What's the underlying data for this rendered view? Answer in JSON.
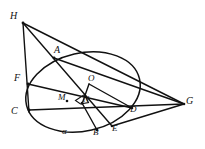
{
  "figure": {
    "background_color": "#ffffff",
    "stroke_color": "#111111",
    "width": 205,
    "height": 149,
    "conic": {
      "name": "ellipse",
      "center_x": 83,
      "center_y": 92,
      "radius_x": 58,
      "radius_y": 39,
      "rotation_deg": -13
    },
    "points": [
      {
        "id": "H",
        "label": "H",
        "x": 23,
        "y": 23,
        "label_x": 10,
        "label_y": 11
      },
      {
        "id": "A",
        "label": "A",
        "x": 54,
        "y": 58,
        "label_x": 54,
        "label_y": 45
      },
      {
        "id": "F",
        "label": "F",
        "x": 28,
        "y": 84,
        "label_x": 14,
        "label_y": 73
      },
      {
        "id": "C",
        "label": "C",
        "x": 29,
        "y": 110,
        "label_x": 11,
        "label_y": 106
      },
      {
        "id": "O",
        "label": "O",
        "x": 89,
        "y": 84,
        "label_x": 88,
        "label_y": 74
      },
      {
        "id": "M",
        "label": "M",
        "x": 67,
        "y": 101,
        "label_x": 58,
        "label_y": 93
      },
      {
        "id": "N",
        "label": "N",
        "x": 82,
        "y": 103,
        "label_x": 83,
        "label_y": 95
      },
      {
        "id": "D",
        "label": "D",
        "x": 132,
        "y": 108,
        "label_x": 130,
        "label_y": 105
      },
      {
        "id": "G",
        "label": "G",
        "x": 184,
        "y": 104,
        "label_x": 186,
        "label_y": 96
      },
      {
        "id": "B",
        "label": "B",
        "x": 97,
        "y": 129,
        "label_x": 93,
        "label_y": 128
      },
      {
        "id": "E",
        "label": "E",
        "x": 112,
        "y": 126,
        "label_x": 112,
        "label_y": 124
      }
    ],
    "annotations": [
      {
        "id": "alpha",
        "label": "α",
        "x": 62,
        "y": 127
      }
    ],
    "segments": [
      {
        "id": "H-G",
        "from": "H",
        "to": "G",
        "note": "upper long chord"
      },
      {
        "id": "H-C",
        "from": "H",
        "to": "C",
        "note": "near vertical left side"
      },
      {
        "id": "H-E",
        "from": "H",
        "to": "E",
        "note": "through A and N"
      },
      {
        "id": "A-G",
        "from": "A",
        "to": "G",
        "note": "through D"
      },
      {
        "id": "C-G",
        "from": "C",
        "to": "G",
        "note": "horizontal baseline through N and D"
      },
      {
        "id": "F-D",
        "from": "F",
        "to": "D",
        "note": "through M"
      },
      {
        "id": "E-G",
        "from": "E",
        "to": "G",
        "note": "lower right chord"
      },
      {
        "id": "N-B",
        "from": "N",
        "to": "B"
      },
      {
        "id": "O-N",
        "from": "O",
        "to": "N",
        "note": "perpendicular drop"
      },
      {
        "id": "O-D",
        "from": "O",
        "to": "D"
      }
    ],
    "right_angle_marker": {
      "at": "N",
      "size": 9,
      "description": "square marking ON perpendicular to CG at N"
    }
  }
}
